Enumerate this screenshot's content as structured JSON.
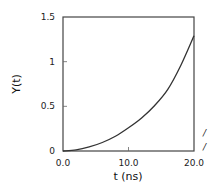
{
  "chart_data": {
    "type": "line",
    "title": "",
    "xlabel": "t (ns)",
    "ylabel": "Y(t)",
    "xlim": [
      0,
      20
    ],
    "ylim": [
      0,
      1.5
    ],
    "xticks": [
      0,
      10,
      20
    ],
    "xtick_labels": [
      "0.0",
      "10.0",
      "20.0"
    ],
    "yticks": [
      0,
      0.5,
      1,
      1.5
    ],
    "ytick_labels": [
      "0",
      "0.5",
      "1",
      "1.5"
    ],
    "grid": false,
    "legend": "none",
    "series": [
      {
        "name": "Y(t)",
        "color": "#333333",
        "x": [
          0,
          2,
          4,
          6,
          8,
          10,
          12,
          14,
          16,
          18,
          20
        ],
        "y": [
          0,
          0.012,
          0.045,
          0.095,
          0.165,
          0.26,
          0.37,
          0.51,
          0.69,
          0.96,
          1.29
        ]
      }
    ],
    "edge_marks": [
      "/",
      "/"
    ]
  }
}
